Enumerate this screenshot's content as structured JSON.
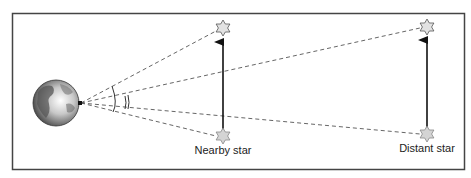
{
  "diagram": {
    "colors": {
      "frame": "#444444",
      "dashed_line": "#555555",
      "arrow": "#111111",
      "star_fill": "#d9d9d9",
      "star_stroke": "#666666"
    },
    "observer": {
      "name": "Earth",
      "icon": "earth-globe-icon"
    },
    "stars": [
      {
        "id": "nearby",
        "label": "Nearby star"
      },
      {
        "id": "distant",
        "label": "Distant star"
      }
    ],
    "angles": [
      {
        "id": "nearby-parallax",
        "description": "large angle (single arc)"
      },
      {
        "id": "distant-parallax",
        "description": "small angle (double arc)"
      }
    ]
  }
}
